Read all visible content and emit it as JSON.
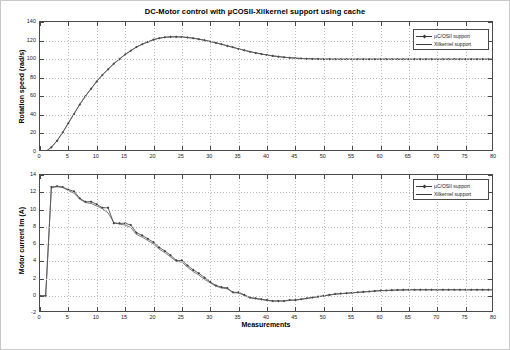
{
  "figure": {
    "title": "DC-Motor control with µCOSII-Xilkernel support using cache",
    "background_color": "#ffffff",
    "border_color": "#c8c8c8"
  },
  "colors": {
    "axis": "#4a4a4a",
    "grid": "#bdbdbd",
    "series_ucosii": "#3a3a3a",
    "series_xilkernel": "#5a5a5a",
    "text": "#1a1a1a"
  },
  "legend": {
    "position": "top-right",
    "entries": [
      {
        "label": "µC/OSII support",
        "marker": "diamond-line"
      },
      {
        "label": "Xilkernel support",
        "marker": "line"
      }
    ]
  },
  "chart_data": [
    {
      "id": "rotation-speed",
      "type": "line",
      "title": "DC-Motor control with µCOSII-Xilkernel support using cache",
      "xlabel": "",
      "ylabel": "Rotation speed (rad/s)",
      "xlim": [
        0,
        80
      ],
      "ylim": [
        0,
        140
      ],
      "xticks": [
        0,
        5,
        10,
        15,
        20,
        25,
        30,
        35,
        40,
        45,
        50,
        55,
        60,
        65,
        70,
        75,
        80
      ],
      "yticks": [
        0,
        20,
        40,
        60,
        80,
        100,
        120,
        140
      ],
      "grid": true,
      "legend": [
        "µC/OSII support",
        "Xilkernel support"
      ],
      "x": [
        0,
        1,
        2,
        3,
        4,
        5,
        6,
        7,
        8,
        9,
        10,
        11,
        12,
        13,
        14,
        15,
        16,
        17,
        18,
        19,
        20,
        21,
        22,
        23,
        24,
        25,
        26,
        27,
        28,
        29,
        30,
        31,
        32,
        33,
        34,
        35,
        36,
        37,
        38,
        39,
        40,
        41,
        42,
        43,
        44,
        45,
        46,
        47,
        48,
        49,
        50,
        51,
        52,
        53,
        54,
        55,
        56,
        57,
        58,
        59,
        60,
        61,
        62,
        63,
        64,
        65,
        66,
        67,
        68,
        69,
        70,
        71,
        72,
        73,
        74,
        75,
        76,
        77,
        78,
        79,
        80
      ],
      "series": [
        {
          "name": "µC/OSII support",
          "values": [
            0,
            0.5,
            5,
            12,
            21,
            31,
            41,
            51,
            60,
            68,
            76,
            83,
            89,
            95,
            100,
            105,
            109,
            113,
            116,
            118.5,
            121,
            122.5,
            123.5,
            124,
            124,
            123.8,
            123.3,
            122.5,
            121.5,
            120.3,
            119,
            117.5,
            116,
            114.3,
            112.7,
            111,
            109.5,
            108,
            106.7,
            105.5,
            104.4,
            103.5,
            102.7,
            102,
            101.5,
            101,
            100.7,
            100.4,
            100.2,
            100.1,
            100,
            100,
            99.9,
            99.9,
            99.9,
            99.9,
            99.9,
            99.9,
            99.9,
            99.9,
            99.9,
            99.9,
            99.9,
            99.9,
            99.9,
            99.9,
            99.9,
            99.9,
            99.9,
            99.9,
            99.9,
            99.9,
            99.9,
            99.9,
            99.9,
            99.9,
            99.9,
            99.9,
            99.9,
            99.9,
            99.9
          ]
        },
        {
          "name": "Xilkernel support",
          "values": [
            0,
            0.5,
            5.2,
            12.3,
            21.4,
            31.4,
            41.4,
            51.3,
            60.3,
            68.3,
            76.2,
            83.2,
            89.2,
            95.2,
            100.2,
            105.1,
            109.2,
            113.1,
            116.1,
            118.6,
            121.1,
            122.6,
            123.6,
            124.1,
            124.1,
            123.9,
            123.4,
            122.6,
            121.6,
            120.4,
            119.1,
            117.6,
            116.1,
            114.4,
            112.8,
            111.1,
            109.6,
            108.1,
            106.8,
            105.6,
            104.5,
            103.6,
            102.8,
            102.1,
            101.6,
            101.1,
            100.8,
            100.5,
            100.3,
            100.2,
            100.1,
            100.1,
            100,
            100,
            100,
            100,
            100,
            100,
            100,
            100,
            100,
            100,
            100,
            100,
            100,
            100,
            100,
            100,
            100,
            100,
            100,
            100,
            100,
            100,
            100,
            100,
            100,
            100,
            100,
            100,
            100
          ]
        }
      ]
    },
    {
      "id": "motor-current",
      "type": "line",
      "title": "",
      "xlabel": "Measurements",
      "ylabel": "Motor current Im (A)",
      "xlim": [
        0,
        80
      ],
      "ylim": [
        -2,
        14
      ],
      "xticks": [
        0,
        5,
        10,
        15,
        20,
        25,
        30,
        35,
        40,
        45,
        50,
        55,
        60,
        65,
        70,
        75,
        80
      ],
      "yticks": [
        -2,
        0,
        2,
        4,
        6,
        8,
        10,
        12,
        14
      ],
      "grid": true,
      "legend": [
        "µC/OSII support",
        "Xilkernel support"
      ],
      "x": [
        0,
        1,
        2,
        3,
        4,
        5,
        6,
        7,
        8,
        9,
        10,
        11,
        12,
        13,
        14,
        15,
        16,
        17,
        18,
        19,
        20,
        21,
        22,
        23,
        24,
        25,
        26,
        27,
        28,
        29,
        30,
        31,
        32,
        33,
        34,
        35,
        36,
        37,
        38,
        39,
        40,
        41,
        42,
        43,
        44,
        45,
        46,
        47,
        48,
        49,
        50,
        51,
        52,
        53,
        54,
        55,
        56,
        57,
        58,
        59,
        60,
        61,
        62,
        63,
        64,
        65,
        66,
        67,
        68,
        69,
        70,
        71,
        72,
        73,
        74,
        75,
        76,
        77,
        78,
        79,
        80
      ],
      "series": [
        {
          "name": "µC/OSII support",
          "values": [
            0,
            0,
            12.6,
            12.7,
            12.6,
            12.3,
            12.1,
            11.3,
            10.9,
            10.9,
            10.6,
            10.2,
            10.2,
            8.4,
            8.4,
            8.4,
            8.2,
            7.3,
            7.0,
            6.6,
            6.2,
            5.6,
            5.2,
            4.7,
            4.1,
            4.1,
            3.5,
            3.0,
            2.6,
            2.1,
            1.6,
            1.2,
            1.0,
            0.9,
            0.4,
            0.4,
            0.1,
            -0.2,
            -0.3,
            -0.4,
            -0.5,
            -0.6,
            -0.6,
            -0.6,
            -0.5,
            -0.5,
            -0.4,
            -0.3,
            -0.2,
            -0.1,
            0,
            0.1,
            0.2,
            0.25,
            0.3,
            0.35,
            0.4,
            0.45,
            0.5,
            0.55,
            0.6,
            0.62,
            0.65,
            0.67,
            0.68,
            0.7,
            0.7,
            0.7,
            0.7,
            0.7,
            0.7,
            0.7,
            0.7,
            0.7,
            0.7,
            0.7,
            0.7,
            0.7,
            0.7,
            0.7,
            0.7
          ]
        },
        {
          "name": "Xilkernel support",
          "values": [
            0,
            0,
            12.5,
            12.65,
            12.55,
            12.2,
            11.9,
            11.2,
            10.8,
            10.7,
            10.4,
            10.1,
            9.6,
            8.5,
            8.3,
            8.2,
            7.9,
            7.1,
            6.8,
            6.4,
            6.0,
            5.4,
            5.0,
            4.5,
            4.0,
            3.9,
            3.3,
            2.8,
            2.4,
            1.9,
            1.5,
            1.1,
            0.9,
            0.8,
            0.35,
            0.3,
            0.05,
            -0.25,
            -0.35,
            -0.45,
            -0.55,
            -0.62,
            -0.62,
            -0.6,
            -0.55,
            -0.5,
            -0.42,
            -0.32,
            -0.22,
            -0.12,
            -0.02,
            0.08,
            0.18,
            0.23,
            0.28,
            0.33,
            0.38,
            0.43,
            0.48,
            0.53,
            0.58,
            0.6,
            0.63,
            0.65,
            0.66,
            0.68,
            0.68,
            0.68,
            0.68,
            0.68,
            0.68,
            0.68,
            0.68,
            0.68,
            0.68,
            0.68,
            0.68,
            0.68,
            0.68,
            0.68,
            0.68
          ]
        }
      ]
    }
  ]
}
